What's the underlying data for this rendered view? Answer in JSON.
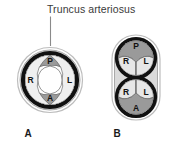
{
  "figure": {
    "title": "Truncus arteriosus",
    "panels": [
      {
        "id": "A",
        "label": "A",
        "description": "single truncus arteriosus with four cusps",
        "cusps": [
          {
            "label": "P",
            "position": "top",
            "shade": "#9a9a9a"
          },
          {
            "label": "R",
            "position": "left",
            "shade": "#e8e8e8"
          },
          {
            "label": "L",
            "position": "right",
            "shade": "#e8e8e8"
          },
          {
            "label": "A",
            "position": "bottom",
            "shade": "#9a9a9a"
          }
        ]
      },
      {
        "id": "B",
        "label": "B",
        "description": "divided truncus forming two separate vessels",
        "vessels": [
          {
            "name": "upper-vessel",
            "cusps": [
              {
                "label": "P",
                "position": "top",
                "shade": "#9a9a9a"
              },
              {
                "label": "R",
                "position": "lower-left",
                "shade": "#e0e0e0"
              },
              {
                "label": "L",
                "position": "lower-right",
                "shade": "#e0e0e0"
              }
            ]
          },
          {
            "name": "lower-vessel",
            "cusps": [
              {
                "label": "R",
                "position": "upper-left",
                "shade": "#e0e0e0"
              },
              {
                "label": "L",
                "position": "upper-right",
                "shade": "#e0e0e0"
              },
              {
                "label": "A",
                "position": "bottom",
                "shade": "#9a9a9a"
              }
            ]
          }
        ]
      }
    ],
    "colors": {
      "background": "#ffffff",
      "outer_ring": "#d6d6d6",
      "outer_ring_stroke": "#8f8f8f",
      "inner_ring": "#111111",
      "cusp_shaded": "#9a9a9a",
      "cusp_light": "#e8e8e8",
      "lumen": "#ffffff",
      "text": "#1a1a1a",
      "title_text": "#3a3a3a",
      "leader_line": "#8a8a8a"
    }
  }
}
